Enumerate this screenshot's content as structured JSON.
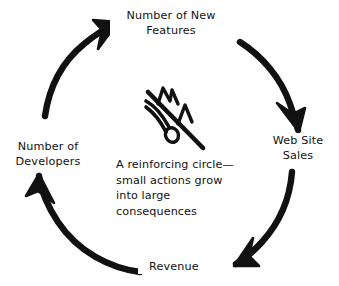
{
  "diagram": {
    "type": "reinforcing-feedback-loop",
    "title": "A reinforcing circle",
    "background_color": "#ffffff",
    "stroke_color": "#111111",
    "direction": "clockwise",
    "nodes": [
      {
        "id": "new-features",
        "label": "Number of New\nFeatures",
        "position": "top"
      },
      {
        "id": "web-site-sales",
        "label": "Web Site\nSales",
        "position": "right"
      },
      {
        "id": "revenue",
        "label": "Revenue",
        "position": "bottom"
      },
      {
        "id": "number-of-developers",
        "label": "Number of\nDevelopers",
        "position": "left"
      }
    ],
    "arrows": [
      {
        "id": "developers-to-features",
        "from": "number-of-developers",
        "to": "new-features",
        "quadrant": "upper-left"
      },
      {
        "id": "features-to-sales",
        "from": "new-features",
        "to": "web-site-sales",
        "quadrant": "upper-right"
      },
      {
        "id": "sales-to-revenue",
        "from": "web-site-sales",
        "to": "revenue",
        "quadrant": "lower-right"
      },
      {
        "id": "revenue-to-developers",
        "from": "revenue",
        "to": "number-of-developers",
        "quadrant": "lower-left"
      }
    ],
    "center_icon": {
      "name": "snowball-rolling-downhill-icon",
      "description": "hand-drawn slope line with two peaks and a small ball with trail"
    },
    "caption": {
      "lines": [
        "A reinforcing circle—",
        "small actions grow",
        "into large",
        "consequences"
      ]
    }
  }
}
